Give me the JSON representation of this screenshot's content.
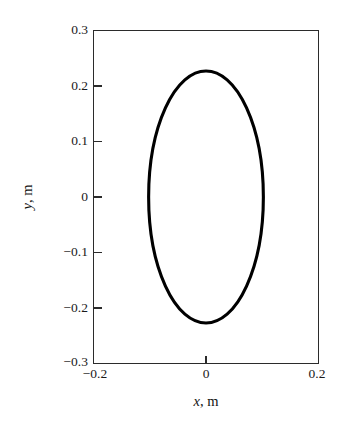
{
  "chart_data": {
    "type": "line",
    "title": "",
    "subtitle": "",
    "xlabel": "x, m",
    "ylabel": "y, m",
    "xlabel_var": "x",
    "xlabel_unit": ", m",
    "ylabel_var": "y",
    "ylabel_unit": ", m",
    "xlim": [
      -0.2,
      0.2
    ],
    "ylim": [
      -0.3,
      0.3
    ],
    "grid": false,
    "legend": null,
    "legend_position": "none",
    "annotations": [],
    "xticks": [
      -0.2,
      0,
      0.2
    ],
    "xticklabels": [
      "−0.2",
      "0",
      "0.2"
    ],
    "yticks": [
      0.3,
      0.2,
      0.1,
      0,
      -0.1,
      -0.2,
      -0.3
    ],
    "yticklabels": [
      "0.3",
      "0.2",
      "0.1",
      "0",
      "−0.1",
      "−0.2",
      "−0.3"
    ],
    "tick_direction": "in",
    "series": [
      {
        "name": "trajectory",
        "shape": "closed-ellipse",
        "center": [
          0,
          0
        ],
        "semi_axis_x": 0.102,
        "semi_axis_y": 0.227,
        "color": "#000000",
        "linewidth": 3.1,
        "x": [
          0.102,
          0.101,
          0.098,
          0.092,
          0.085,
          0.075,
          0.063,
          0.05,
          0.035,
          0.019,
          0.003,
          -0.013,
          -0.029,
          -0.044,
          -0.058,
          -0.071,
          -0.082,
          -0.091,
          -0.098,
          -0.101,
          -0.102,
          -0.101,
          -0.098,
          -0.091,
          -0.082,
          -0.071,
          -0.058,
          -0.044,
          -0.029,
          -0.013,
          0.003,
          0.019,
          0.035,
          0.05,
          0.063,
          0.075,
          0.085,
          0.092,
          0.098,
          0.101,
          0.102
        ],
        "y": [
          0.0,
          0.036,
          0.071,
          0.105,
          0.137,
          0.166,
          0.191,
          0.212,
          0.228,
          0.238,
          0.241,
          0.239,
          0.231,
          0.217,
          0.197,
          0.172,
          0.143,
          0.11,
          0.075,
          0.038,
          0.0,
          -0.038,
          -0.075,
          -0.11,
          -0.143,
          -0.172,
          -0.197,
          -0.217,
          -0.231,
          -0.239,
          -0.241,
          -0.238,
          -0.228,
          -0.212,
          -0.191,
          -0.166,
          -0.137,
          -0.105,
          -0.071,
          -0.036,
          0.0
        ]
      }
    ]
  },
  "figure": {
    "background": "#ffffff",
    "frame_color": "#2b2b2b",
    "curve_color": "#000000"
  }
}
